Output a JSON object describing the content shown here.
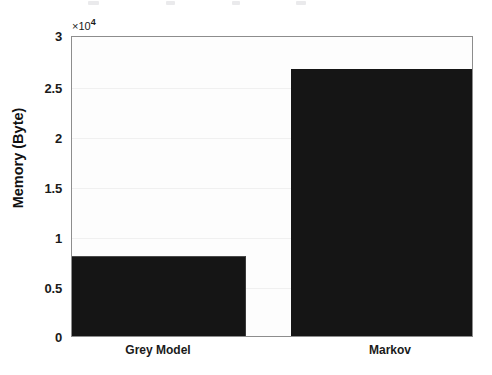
{
  "chart_data": {
    "type": "bar",
    "title": "",
    "xlabel": "",
    "ylabel": "Memory (Byte)",
    "categories": [
      "Grey Model",
      "Markov"
    ],
    "values": [
      8000,
      26800
    ],
    "ylim": [
      0,
      30000
    ],
    "yticks": [
      0,
      5000,
      10000,
      15000,
      20000,
      25000,
      30000
    ],
    "ytick_labels": [
      "0",
      "0.5",
      "1",
      "1.5",
      "2",
      "2.5",
      "3"
    ],
    "y_exponent_label": "×10",
    "y_exponent_power": "4",
    "y_axis_multiplier": 10000,
    "grid": true,
    "legend": null,
    "bar_color": "#151515",
    "plot_background": "#fdfdfd",
    "axis_color": "#8d8d8d",
    "series": [
      {
        "name": "Memory (Byte)",
        "values": [
          8000,
          26800
        ]
      }
    ]
  },
  "axes": {
    "y_title": "Memory (Byte)",
    "exponent_times": "×10",
    "exponent_power": "4",
    "ticks": [
      {
        "label": "3",
        "value": 30000
      },
      {
        "label": "2.5",
        "value": 25000
      },
      {
        "label": "2",
        "value": 20000
      },
      {
        "label": "1.5",
        "value": 15000
      },
      {
        "label": "1",
        "value": 10000
      },
      {
        "label": "0.5",
        "value": 5000
      },
      {
        "label": "0",
        "value": 0
      }
    ],
    "categories": [
      {
        "label": "Grey Model",
        "value": 8000
      },
      {
        "label": "Markov",
        "value": 26800
      }
    ]
  }
}
